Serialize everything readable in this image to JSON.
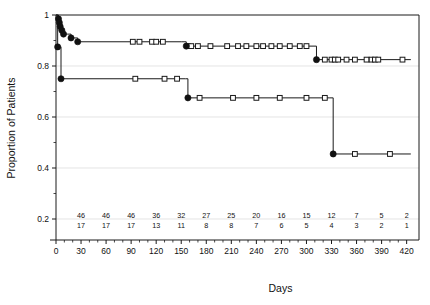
{
  "chart_data": {
    "type": "line",
    "title": "",
    "xlabel": "Days",
    "ylabel": "Proportion of Patients",
    "xlim": [
      0,
      430
    ],
    "ylim": [
      0.1,
      1.02
    ],
    "xticks": [
      0,
      30,
      60,
      90,
      120,
      150,
      180,
      210,
      240,
      270,
      300,
      330,
      360,
      390,
      420
    ],
    "xtick_labels": [
      "0",
      "30",
      "60",
      "90",
      "120",
      "150",
      "180",
      "210",
      "240",
      "270",
      "300",
      "330",
      "360",
      "390",
      "420"
    ],
    "yticks": [
      0.2,
      0.4,
      0.6,
      0.8,
      1.0
    ],
    "ytick_labels": [
      "0.2",
      "0.4",
      "0.6",
      "0.8",
      "1"
    ],
    "grid": true,
    "grid_axis": "y",
    "legend": "none",
    "plot_style": "kaplan-meier-step",
    "series": [
      {
        "name": "upper-curve",
        "marker": "filled-circle-and-open-square",
        "steps": [
          {
            "x": 0,
            "y": 1.0
          },
          {
            "x": 3,
            "y": 0.985
          },
          {
            "x": 4,
            "y": 0.97
          },
          {
            "x": 5,
            "y": 0.955
          },
          {
            "x": 7,
            "y": 0.94
          },
          {
            "x": 9,
            "y": 0.925
          },
          {
            "x": 14,
            "y": 0.925
          },
          {
            "x": 18,
            "y": 0.91
          },
          {
            "x": 26,
            "y": 0.895
          },
          {
            "x": 150,
            "y": 0.895
          },
          {
            "x": 156,
            "y": 0.878
          },
          {
            "x": 300,
            "y": 0.878
          },
          {
            "x": 312,
            "y": 0.825
          },
          {
            "x": 425,
            "y": 0.825
          }
        ],
        "event_points_x": [
          3,
          4,
          5,
          7,
          9,
          18,
          26,
          156,
          312
        ],
        "censor_points_x": [
          92,
          100,
          115,
          120,
          128,
          158,
          162,
          170,
          185,
          205,
          218,
          228,
          240,
          248,
          258,
          268,
          280,
          292,
          300,
          322,
          330,
          334,
          338,
          348,
          358,
          372,
          378,
          382,
          386,
          415
        ]
      },
      {
        "name": "lower-curve",
        "marker": "filled-circle-and-open-square",
        "steps": [
          {
            "x": 0,
            "y": 1.0
          },
          {
            "x": 2,
            "y": 0.875
          },
          {
            "x": 6,
            "y": 0.75
          },
          {
            "x": 155,
            "y": 0.75
          },
          {
            "x": 158,
            "y": 0.675
          },
          {
            "x": 328,
            "y": 0.675
          },
          {
            "x": 332,
            "y": 0.455
          },
          {
            "x": 425,
            "y": 0.455
          }
        ],
        "event_points_x": [
          2,
          6,
          158,
          332
        ],
        "censor_points_x": [
          95,
          130,
          145,
          172,
          212,
          240,
          268,
          300,
          322,
          358,
          400
        ]
      }
    ],
    "risk_table": {
      "x_positions": [
        30,
        60,
        90,
        120,
        150,
        180,
        210,
        240,
        270,
        300,
        330,
        360,
        390,
        420
      ],
      "rows": [
        {
          "name": "row-1",
          "values": [
            "46",
            "46",
            "46",
            "36",
            "32",
            "27",
            "25",
            "20",
            "16",
            "15",
            "12",
            "7",
            "5",
            "2"
          ]
        },
        {
          "name": "row-2",
          "values": [
            "17",
            "17",
            "17",
            "13",
            "11",
            "8",
            "8",
            "7",
            "6",
            "5",
            "4",
            "3",
            "2",
            "1"
          ]
        }
      ]
    }
  }
}
